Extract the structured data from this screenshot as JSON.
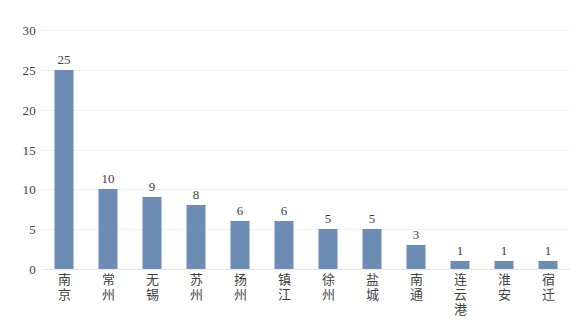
{
  "chart_data": {
    "type": "bar",
    "title": "",
    "subtitle": "",
    "xlabel": "",
    "ylabel": "",
    "categories": [
      "南京",
      "常州",
      "无锡",
      "苏州",
      "扬州",
      "镇江",
      "徐州",
      "盐城",
      "南通",
      "连云港",
      "淮安",
      "宿迁"
    ],
    "values": [
      25,
      10,
      9,
      8,
      6,
      6,
      5,
      5,
      3,
      1,
      1,
      1
    ],
    "ylim": [
      0,
      30
    ],
    "yticks": [
      0,
      5,
      10,
      15,
      20,
      25,
      30
    ],
    "ytick_labels": [
      "0",
      "5",
      "10",
      "15",
      "20",
      "25",
      "30"
    ],
    "data_labels": [
      "25",
      "10",
      "9",
      "8",
      "6",
      "6",
      "5",
      "5",
      "3",
      "1",
      "1",
      "1"
    ],
    "grid": true,
    "grid_axis": "y",
    "legend": false,
    "legend_position": "none",
    "series": [
      {
        "name": "",
        "values": [
          25,
          10,
          9,
          8,
          6,
          6,
          5,
          5,
          3,
          1,
          1,
          1
        ],
        "color": "#6d8cb4"
      }
    ]
  },
  "colors": {
    "bar": "#6d8cb4",
    "gridline": "#f2f2f2",
    "axis": "#e4e4e4",
    "text": "#3f3f3f",
    "background": "#ffffff"
  }
}
